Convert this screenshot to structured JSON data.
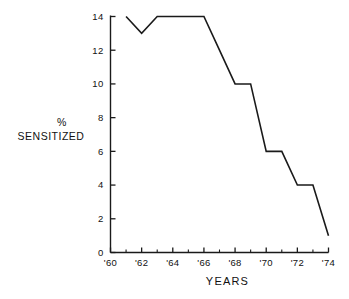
{
  "chart_data": {
    "type": "line",
    "title": "",
    "xlabel": "YEARS",
    "ylabel": "% SENSITIZED",
    "ylabel_lines": [
      "%",
      "SENSITIZED"
    ],
    "x": [
      1961,
      1962,
      1963,
      1964,
      1965,
      1966,
      1967,
      1968,
      1969,
      1970,
      1971,
      1972,
      1973,
      1974
    ],
    "values": [
      14,
      13,
      14,
      14,
      14,
      14,
      12,
      10,
      10,
      6,
      6,
      4,
      4,
      1
    ],
    "series": [
      {
        "name": "% Sensitized",
        "values": [
          14,
          13,
          14,
          14,
          14,
          14,
          12,
          10,
          10,
          6,
          6,
          4,
          4,
          1
        ]
      }
    ],
    "xlim": [
      1960,
      1974
    ],
    "ylim": [
      0,
      14
    ],
    "xticks": [
      1960,
      1962,
      1964,
      1966,
      1968,
      1970,
      1972,
      1974
    ],
    "xticklabels": [
      "'60",
      "'62",
      "'64",
      "'66",
      "'68",
      "'70",
      "'72",
      "'74"
    ],
    "xminorticks": [
      1961,
      1963,
      1965,
      1967,
      1969,
      1971,
      1973
    ],
    "yticks": [
      0,
      2,
      4,
      6,
      8,
      10,
      12,
      14
    ],
    "yticklabels": [
      "0",
      "2",
      "4",
      "6",
      "8",
      "10",
      "12",
      "14"
    ],
    "grid": false,
    "legend": null,
    "line_color": "#1a1a1a",
    "axis_color": "#1a1a1a",
    "background": "#ffffff"
  }
}
